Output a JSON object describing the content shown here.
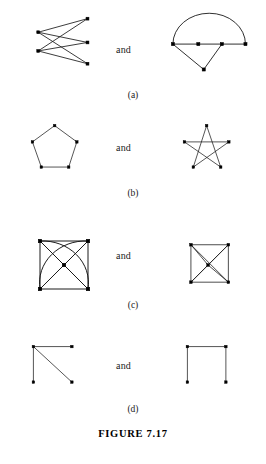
{
  "figure": {
    "caption": "FIGURE 7.17",
    "conjunction": "and",
    "ink_color": "#1a1a1a",
    "vertex_color": "#000000",
    "background_color": "#ffffff"
  },
  "rows": [
    {
      "label": "(a)",
      "left": {
        "name": "complete-bipartite-k23",
        "vertices": [
          {
            "id": "L1",
            "x": 12,
            "y": 28
          },
          {
            "id": "L2",
            "x": 12,
            "y": 50
          },
          {
            "id": "R1",
            "x": 70,
            "y": 12
          },
          {
            "id": "R2",
            "x": 70,
            "y": 40
          },
          {
            "id": "R3",
            "x": 70,
            "y": 65
          }
        ],
        "edges": [
          [
            "L1",
            "R1"
          ],
          [
            "L1",
            "R2"
          ],
          [
            "L1",
            "R3"
          ],
          [
            "L2",
            "R1"
          ],
          [
            "L2",
            "R2"
          ],
          [
            "L2",
            "R3"
          ]
        ],
        "arcs": []
      },
      "right": {
        "name": "path-with-arc-and-triangle",
        "vertices": [
          {
            "id": "A",
            "x": 8,
            "y": 42
          },
          {
            "id": "B",
            "x": 36,
            "y": 42
          },
          {
            "id": "C",
            "x": 62,
            "y": 42
          },
          {
            "id": "D",
            "x": 88,
            "y": 42
          },
          {
            "id": "E",
            "x": 42,
            "y": 70
          }
        ],
        "edges": [
          [
            "A",
            "B"
          ],
          [
            "B",
            "C"
          ],
          [
            "C",
            "D"
          ],
          [
            "A",
            "E"
          ],
          [
            "C",
            "E"
          ]
        ],
        "arcs": [
          {
            "from": "A",
            "to": "D",
            "rx": 40,
            "ry": 34,
            "sweep": 1
          }
        ]
      }
    },
    {
      "label": "(b)",
      "left": {
        "name": "pentagon-cycle-c5",
        "vertices": [
          {
            "id": "P1",
            "x": 36,
            "y": 6
          },
          {
            "id": "P2",
            "x": 66,
            "y": 28
          },
          {
            "id": "P3",
            "x": 55,
            "y": 62
          },
          {
            "id": "P4",
            "x": 18,
            "y": 62
          },
          {
            "id": "P5",
            "x": 6,
            "y": 28
          }
        ],
        "edges": [
          [
            "P1",
            "P2"
          ],
          [
            "P2",
            "P3"
          ],
          [
            "P3",
            "P4"
          ],
          [
            "P4",
            "P5"
          ],
          [
            "P5",
            "P1"
          ]
        ],
        "arcs": []
      },
      "right": {
        "name": "pentagram-star-c5",
        "vertices": [
          {
            "id": "S1",
            "x": 36,
            "y": 6
          },
          {
            "id": "S2",
            "x": 66,
            "y": 28
          },
          {
            "id": "S3",
            "x": 55,
            "y": 62
          },
          {
            "id": "S4",
            "x": 18,
            "y": 62
          },
          {
            "id": "S5",
            "x": 6,
            "y": 28
          }
        ],
        "edges": [
          [
            "S1",
            "S3"
          ],
          [
            "S3",
            "S5"
          ],
          [
            "S5",
            "S2"
          ],
          [
            "S2",
            "S4"
          ],
          [
            "S4",
            "S1"
          ]
        ],
        "arcs": []
      }
    },
    {
      "label": "(c)",
      "left": {
        "name": "square-with-center-and-two-arcs",
        "vertices": [
          {
            "id": "TL",
            "x": 26,
            "y": 26
          },
          {
            "id": "TR",
            "x": 74,
            "y": 26
          },
          {
            "id": "BR",
            "x": 74,
            "y": 74
          },
          {
            "id": "BL",
            "x": 26,
            "y": 74
          },
          {
            "id": "CT",
            "x": 50,
            "y": 50
          }
        ],
        "edges": [
          [
            "TL",
            "TR"
          ],
          [
            "TR",
            "BR"
          ],
          [
            "BR",
            "BL"
          ],
          [
            "BL",
            "TL"
          ],
          [
            "TL",
            "CT"
          ],
          [
            "TR",
            "CT"
          ],
          [
            "BR",
            "CT"
          ],
          [
            "BL",
            "CT"
          ]
        ],
        "arcs": [
          {
            "from": "TL",
            "to": "BR",
            "rx": 46,
            "ry": 42,
            "sweep": 1
          },
          {
            "from": "TR",
            "to": "BL",
            "rx": 46,
            "ry": 42,
            "sweep": 0
          }
        ]
      },
      "right": {
        "name": "square-with-center-and-diagonals",
        "vertices": [
          {
            "id": "TL",
            "x": 14,
            "y": 26
          },
          {
            "id": "TR",
            "x": 62,
            "y": 26
          },
          {
            "id": "BR",
            "x": 62,
            "y": 74
          },
          {
            "id": "BL",
            "x": 14,
            "y": 74
          },
          {
            "id": "CT",
            "x": 36,
            "y": 52
          }
        ],
        "edges": [
          [
            "TL",
            "TR"
          ],
          [
            "TR",
            "BR"
          ],
          [
            "BR",
            "BL"
          ],
          [
            "BL",
            "TL"
          ],
          [
            "TL",
            "BR"
          ],
          [
            "TR",
            "BL"
          ],
          [
            "TL",
            "CT"
          ],
          [
            "TR",
            "CT"
          ],
          [
            "BR",
            "CT"
          ],
          [
            "BL",
            "CT"
          ]
        ],
        "arcs": []
      }
    },
    {
      "label": "(d)",
      "left": {
        "name": "star-k13-three-leaves",
        "vertices": [
          {
            "id": "H",
            "x": 10,
            "y": 10
          },
          {
            "id": "N1",
            "x": 62,
            "y": 10
          },
          {
            "id": "N2",
            "x": 10,
            "y": 58
          },
          {
            "id": "N3",
            "x": 62,
            "y": 58
          }
        ],
        "edges": [
          [
            "H",
            "N1"
          ],
          [
            "H",
            "N2"
          ],
          [
            "H",
            "N3"
          ]
        ],
        "arcs": []
      },
      "right": {
        "name": "path-p4-open-square",
        "vertices": [
          {
            "id": "Q1",
            "x": 10,
            "y": 10
          },
          {
            "id": "Q2",
            "x": 62,
            "y": 10
          },
          {
            "id": "Q3",
            "x": 62,
            "y": 58
          },
          {
            "id": "Q4",
            "x": 10,
            "y": 58
          }
        ],
        "edges": [
          [
            "Q1",
            "Q2"
          ],
          [
            "Q2",
            "Q3"
          ],
          [
            "Q1",
            "Q4"
          ]
        ],
        "arcs": []
      }
    }
  ]
}
